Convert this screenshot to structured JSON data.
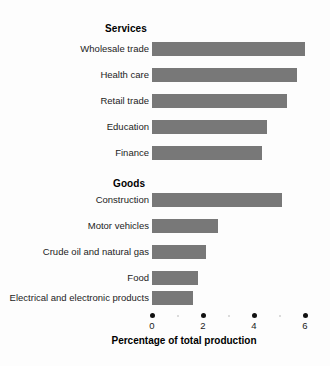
{
  "chart_data": {
    "type": "bar",
    "orientation": "horizontal",
    "title": "",
    "xlabel": "Percentage of total production",
    "ylabel": "",
    "xlim": [
      0,
      6.2
    ],
    "xticks": [
      0,
      2,
      4,
      6
    ],
    "xtick_labels": [
      "0",
      "2",
      "4",
      "6"
    ],
    "minor_xticks": [
      1,
      3,
      5
    ],
    "grid": false,
    "legend": false,
    "bar_color": "#787878",
    "background_color": "#fdfdfd",
    "groups": [
      {
        "name": "Services",
        "categories": [
          "Wholesale trade",
          "Health care",
          "Retail trade",
          "Education",
          "Finance"
        ],
        "values": [
          6.0,
          5.7,
          5.3,
          4.5,
          4.3
        ]
      },
      {
        "name": "Goods",
        "categories": [
          "Construction",
          "Motor vehicles",
          "Crude oil and natural gas",
          "Food",
          "Electrical and electronic products"
        ],
        "values": [
          5.1,
          2.6,
          2.1,
          1.8,
          1.6
        ]
      }
    ],
    "categories": [
      "Wholesale trade",
      "Health care",
      "Retail trade",
      "Education",
      "Finance",
      "Construction",
      "Motor vehicles",
      "Crude oil and natural gas",
      "Food",
      "Electrical and electronic products"
    ],
    "values": [
      6.0,
      5.7,
      5.3,
      4.5,
      4.3,
      5.1,
      2.6,
      2.1,
      1.8,
      1.6
    ]
  }
}
